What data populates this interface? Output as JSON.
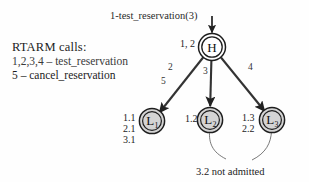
{
  "figure": {
    "top_call_label": "1-test_reservation(3)",
    "legend": {
      "title": "RTARM calls:",
      "line1": "1,2,3,4 – test_reservation",
      "line2": "5 – cancel_reservation"
    },
    "bottom_note": "3.2 not admitted"
  },
  "nodes": {
    "root": {
      "id": "H",
      "letter": "H",
      "subscript": "",
      "side_label": "1, 2",
      "fill": "#ffffff",
      "cx": 212,
      "cy": 47,
      "r": 12
    },
    "leaves": [
      {
        "id": "L1",
        "letter": "L",
        "subscript": "1",
        "side_labels": [
          "1.1",
          "2.1",
          "3.1"
        ],
        "fill": "#d4d4d4",
        "cx": 152,
        "cy": 121,
        "r": 11.5
      },
      {
        "id": "L2",
        "letter": "L",
        "subscript": "2",
        "side_labels": [
          "1.2"
        ],
        "fill": "#d4d4d4",
        "cx": 210,
        "cy": 120,
        "r": 11.5
      },
      {
        "id": "L3",
        "letter": "L",
        "subscript": "3",
        "side_labels": [
          "1.3",
          "2.2"
        ],
        "fill": "#d4d4d4",
        "cx": 272,
        "cy": 120,
        "r": 11.5
      }
    ]
  },
  "edges": [
    {
      "from": "H",
      "to": "L1",
      "labels": [
        "2",
        "5"
      ]
    },
    {
      "from": "H",
      "to": "L2",
      "labels": [
        "3"
      ]
    },
    {
      "from": "H",
      "to": "L3",
      "labels": [
        "4"
      ]
    }
  ],
  "colors": {
    "stroke": "#222222",
    "node_fill_root": "#ffffff",
    "node_fill_leaf": "#d4d4d4",
    "text": "#1c1c1c",
    "background": "#ffffff"
  }
}
